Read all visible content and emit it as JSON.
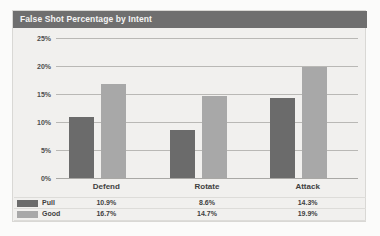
{
  "chart_data": {
    "type": "bar",
    "title": "False Shot Percentage by Intent",
    "categories": [
      "Defend",
      "Rotate",
      "Attack"
    ],
    "series": [
      {
        "name": "Pull",
        "color": "#6b6b6b",
        "values": [
          10.9,
          8.6,
          14.3
        ],
        "value_labels": [
          "10.9%",
          "8.6%",
          "14.3%"
        ]
      },
      {
        "name": "Good",
        "color": "#a8a8a8",
        "values": [
          16.7,
          14.7,
          19.9
        ],
        "value_labels": [
          "16.7%",
          "14.7%",
          "19.9%"
        ]
      }
    ],
    "xlabel": "",
    "ylabel": "",
    "ylim": [
      0,
      25
    ],
    "ytick_values": [
      0,
      5,
      10,
      15,
      20,
      25
    ],
    "ytick_labels": [
      "0%",
      "5%",
      "10%",
      "15%",
      "20%",
      "25%"
    ],
    "grid": true,
    "legend": "data-table-below",
    "value_format": "percent"
  },
  "panel": {
    "title": "False Shot Percentage by Intent",
    "title_bar_color": "#6f6f6f",
    "background_color": "#f1f0ee"
  }
}
